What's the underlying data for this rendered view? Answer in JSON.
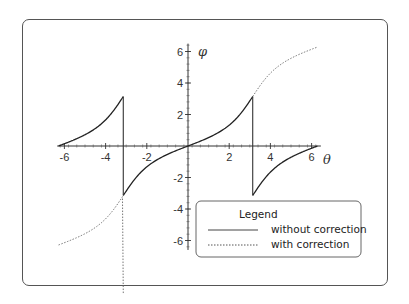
{
  "chart_data": {
    "type": "line",
    "title": "",
    "xlabel": "θ",
    "ylabel": "φ",
    "xlim": [
      -6.28,
      6.28
    ],
    "ylim": [
      -6.5,
      6.5
    ],
    "x_ticks": [
      -6,
      -4,
      -2,
      2,
      4,
      6
    ],
    "y_ticks": [
      6,
      4,
      2,
      -2,
      -4,
      -6
    ],
    "grid": false,
    "legend_position": "lower right",
    "legend": {
      "title": "Legend",
      "entries": [
        {
          "label": "without correction",
          "style": "solid"
        },
        {
          "label": "with correction",
          "style": "dotted"
        }
      ]
    },
    "series": [
      {
        "name": "without correction",
        "formula": "phi = 2*arctan(0.5*tan(theta/2)), wrapped to (-pi, pi]",
        "x": [
          -6.28,
          -5,
          -4,
          -3.5,
          -3.14,
          -3.14,
          -2.5,
          -2,
          -1,
          0,
          1,
          2,
          2.5,
          3.14,
          3.14,
          3.5,
          4,
          5,
          6.28
        ],
        "values": [
          0.0,
          0.82,
          1.66,
          2.42,
          3.14,
          -3.14,
          -1.94,
          -1.32,
          -0.54,
          0.0,
          0.54,
          1.32,
          1.94,
          3.14,
          -3.14,
          -2.42,
          -1.66,
          -0.82,
          0.0
        ]
      },
      {
        "name": "with correction",
        "formula": "continuous unwrapped phase",
        "x": [
          -6.28,
          -5,
          -4,
          -3.5,
          -3.14,
          3.14,
          3.5,
          4,
          5,
          6.28
        ],
        "values": [
          -6.28,
          -5.46,
          -4.62,
          -3.86,
          -3.14,
          3.14,
          3.86,
          4.62,
          5.46,
          6.28
        ]
      }
    ]
  },
  "colors": {
    "curve": "#222222",
    "axis": "#333333",
    "frame": "#555555"
  }
}
